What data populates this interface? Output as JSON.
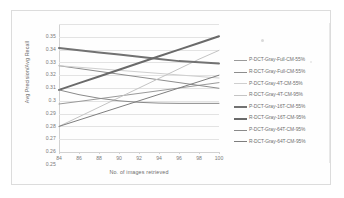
{
  "chart_data": {
    "type": "line",
    "title": "",
    "xlabel": "No. of images retrieved",
    "ylabel": "Avg Precision/Avg Recall",
    "x": [
      84,
      86,
      88,
      90,
      92,
      94,
      96,
      98,
      100
    ],
    "xlim": [
      84,
      100
    ],
    "ylim": [
      0.25,
      0.35
    ],
    "xticks": [
      "84",
      "86",
      "88",
      "90",
      "92",
      "94",
      "96",
      "98",
      "100"
    ],
    "yticks": [
      "0.25",
      "0.26",
      "0.27",
      "0.28",
      "0.29",
      "0.3",
      "0.31",
      "0.32",
      "0.33",
      "0.34",
      "0.35"
    ],
    "grid": true,
    "legend_position": "right",
    "series": [
      {
        "name": "P-DCT-Gray-Full-CM-55%",
        "color": "#9a9a9a",
        "width": 1.0,
        "values": [
          0.2875,
          0.2895,
          0.2916,
          0.2937,
          0.2958,
          0.2979,
          0.3,
          0.3021,
          0.3042
        ]
      },
      {
        "name": "R-DCT-Gray-Full-CM-55%",
        "color": "#8d8d8d",
        "width": 1.0,
        "values": [
          0.3174,
          0.3152,
          0.313,
          0.3108,
          0.3086,
          0.3064,
          0.3042,
          0.302,
          0.2998
        ]
      },
      {
        "name": "P-DCT-Gray-4T-CM-55%",
        "color": "#cfcfcf",
        "width": 1.0,
        "values": [
          0.3174,
          0.3162,
          0.315,
          0.3138,
          0.3126,
          0.3114,
          0.3102,
          0.309,
          0.3078
        ]
      },
      {
        "name": "R-DCT-Gray-4T-CM-95%",
        "color": "#c4c4c4",
        "width": 1.0,
        "values": [
          0.27,
          0.2775,
          0.285,
          0.2925,
          0.3,
          0.3075,
          0.315,
          0.3225,
          0.3294
        ]
      },
      {
        "name": "P-DCT-Gray-16T-CM-55%",
        "color": "#727272",
        "width": 2.0,
        "values": [
          0.3312,
          0.3295,
          0.3278,
          0.3261,
          0.3244,
          0.3227,
          0.321,
          0.3201,
          0.3192
        ]
      },
      {
        "name": "R-DCT-Gray-16T-CM-95%",
        "color": "#6a6a6a",
        "width": 2.0,
        "values": [
          0.2985,
          0.3038,
          0.309,
          0.3143,
          0.3195,
          0.3248,
          0.33,
          0.3352,
          0.3404
        ]
      },
      {
        "name": "P-DCT-Gray-64T-CM-95%",
        "color": "#8a8a8a",
        "width": 1.0,
        "values": [
          0.2985,
          0.2948,
          0.292,
          0.29,
          0.2888,
          0.2882,
          0.288,
          0.288,
          0.288
        ]
      },
      {
        "name": "R-DCT-Gray-64T-CM-95%",
        "color": "#7e7e7e",
        "width": 1.0,
        "values": [
          0.27,
          0.275,
          0.28,
          0.285,
          0.29,
          0.295,
          0.3,
          0.305,
          0.31
        ]
      }
    ]
  }
}
